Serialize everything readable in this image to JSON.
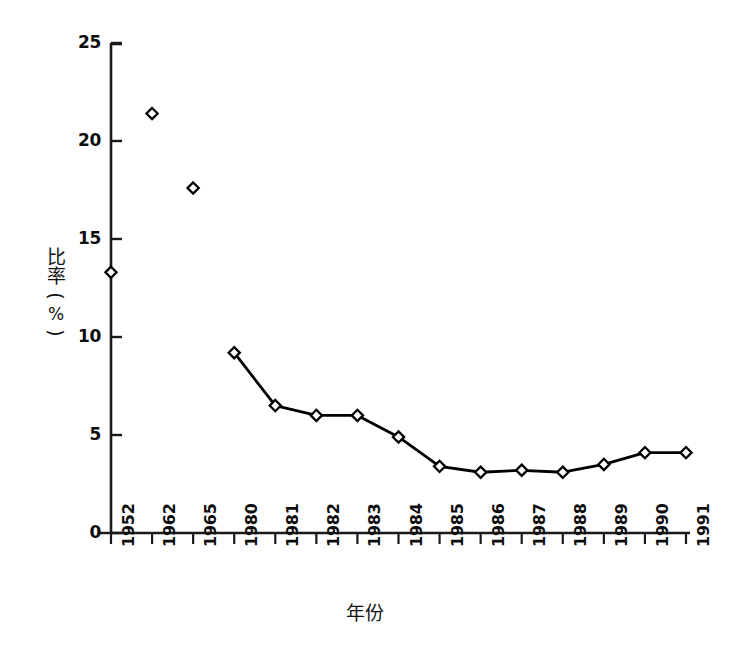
{
  "chart_data": {
    "type": "line",
    "title": "",
    "subtitle": "",
    "xlabel": "年份",
    "ylabel": "比率(%)",
    "ylabel_parts": [
      "比",
      "率",
      "(",
      "%",
      ")"
    ],
    "categories": [
      "1952",
      "1962",
      "1965",
      "1980",
      "1981",
      "1982",
      "1983",
      "1984",
      "1985",
      "1986",
      "1987",
      "1988",
      "1989",
      "1990",
      "1991"
    ],
    "values": [
      13.3,
      21.4,
      17.6,
      9.2,
      6.5,
      6.0,
      6.0,
      4.9,
      3.4,
      3.1,
      3.2,
      3.1,
      3.5,
      4.1,
      4.1
    ],
    "series": [
      {
        "name": "比率",
        "values": [
          13.3,
          21.4,
          17.6,
          9.2,
          6.5,
          6.0,
          6.0,
          4.9,
          3.4,
          3.1,
          3.2,
          3.1,
          3.5,
          4.1,
          4.1
        ],
        "connected_from_index": 3,
        "marker": "open-diamond",
        "color": "#000000"
      }
    ],
    "ylim": [
      0,
      25
    ],
    "yticks": [
      0,
      5,
      10,
      15,
      20,
      25
    ],
    "ytick_labels": [
      "0",
      "5",
      "10",
      "15",
      "20",
      "25"
    ],
    "grid": false,
    "legend": "none",
    "line_color": "#000000",
    "marker_fill": "#ffffff",
    "marker_edge": "#000000",
    "axis_color": "#1a1a1a",
    "background": "#ffffff"
  }
}
